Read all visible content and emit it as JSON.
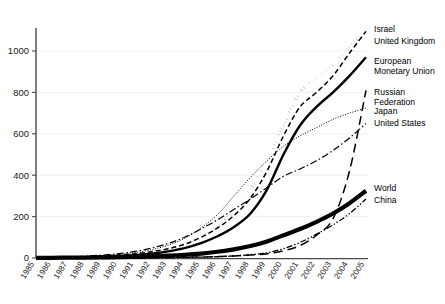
{
  "chart_data": {
    "type": "line",
    "title": "",
    "subtitle": "",
    "xlabel": "",
    "ylabel": "",
    "xlim": [
      1985,
      2005
    ],
    "ylim": [
      0,
      1150
    ],
    "grid": true,
    "legend_position": "right-inline",
    "x": [
      1985,
      1986,
      1987,
      1988,
      1989,
      1990,
      1991,
      1992,
      1993,
      1994,
      1995,
      1996,
      1997,
      1998,
      1999,
      2000,
      2001,
      2002,
      2003,
      2004,
      2005
    ],
    "yticks": [
      0,
      200,
      400,
      600,
      800,
      1000
    ],
    "xticks": [
      "1985",
      "1986",
      "1987",
      "1988",
      "1989",
      "1990",
      "1991",
      "1992",
      "1993",
      "1994",
      "1995",
      "1996",
      "1997",
      "1998",
      "1999",
      "2000",
      "2001",
      "2002",
      "2003",
      "2004",
      "2005"
    ],
    "series": [
      {
        "name": "Israel",
        "style": "thick-dotted",
        "values": [
          2,
          3,
          4,
          6,
          9,
          13,
          19,
          28,
          42,
          62,
          95,
          150,
          230,
          330,
          470,
          640,
          800,
          870,
          930,
          1020,
          1100
        ]
      },
      {
        "name": "United Kingdom",
        "style": "dashed",
        "values": [
          2,
          3,
          4,
          6,
          9,
          14,
          20,
          30,
          45,
          66,
          100,
          145,
          205,
          290,
          420,
          590,
          730,
          800,
          880,
          990,
          1095
        ]
      },
      {
        "name": "European Monetary Union",
        "style": "thick-solid",
        "values": [
          1,
          2,
          3,
          4,
          6,
          9,
          14,
          21,
          32,
          48,
          72,
          105,
          150,
          215,
          330,
          500,
          640,
          730,
          800,
          880,
          970
        ]
      },
      {
        "name": "Russian Federation",
        "style": "long-dash",
        "values": [
          0,
          0,
          0,
          0,
          0,
          1,
          1,
          2,
          3,
          4,
          5,
          7,
          10,
          14,
          20,
          35,
          60,
          110,
          190,
          420,
          810
        ]
      },
      {
        "name": "Japan",
        "style": "fine-dotted",
        "values": [
          2,
          3,
          5,
          7,
          11,
          17,
          26,
          40,
          62,
          95,
          145,
          210,
          300,
          390,
          470,
          540,
          590,
          630,
          670,
          700,
          725
        ]
      },
      {
        "name": "United States",
        "style": "dash-dot",
        "values": [
          2,
          4,
          6,
          9,
          14,
          21,
          32,
          48,
          70,
          100,
          140,
          185,
          235,
          285,
          340,
          395,
          430,
          470,
          520,
          580,
          650
        ]
      },
      {
        "name": "World",
        "style": "extra-thick-solid",
        "values": [
          1,
          1,
          2,
          2,
          3,
          4,
          6,
          8,
          11,
          15,
          21,
          30,
          42,
          58,
          80,
          110,
          140,
          175,
          215,
          265,
          325
        ]
      },
      {
        "name": "China",
        "style": "dash-dot-dot",
        "values": [
          0,
          0,
          0,
          0,
          0,
          0,
          1,
          1,
          2,
          3,
          4,
          6,
          10,
          16,
          25,
          45,
          75,
          115,
          160,
          215,
          285
        ]
      }
    ],
    "legend_labels": [
      {
        "lines": [
          "Israel"
        ]
      },
      {
        "lines": [
          "United Kingdom"
        ]
      },
      {
        "lines": [
          "European",
          "Monetary Union"
        ]
      },
      {
        "lines": [
          "Russian",
          "Federation"
        ]
      },
      {
        "lines": [
          "Japan"
        ]
      },
      {
        "lines": [
          "United States"
        ]
      },
      {
        "lines": [
          "World"
        ]
      },
      {
        "lines": [
          "China"
        ]
      }
    ]
  },
  "colors": {
    "ink": "#000000",
    "axis": "#4a4a4a",
    "grid": "#ececec",
    "background": "#ffffff"
  }
}
